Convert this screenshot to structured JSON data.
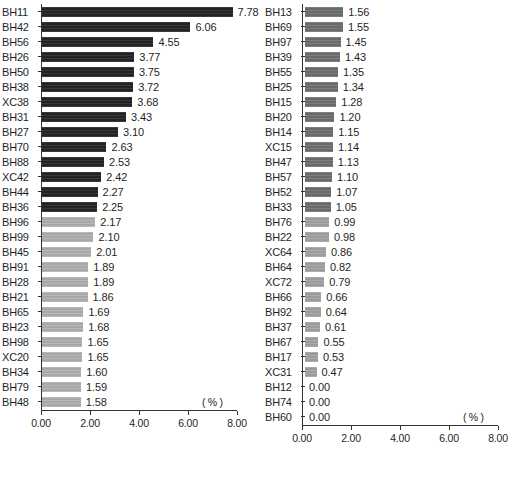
{
  "chart_data": [
    {
      "type": "bar",
      "orientation": "horizontal",
      "panel": "left",
      "title": "",
      "xlabel": "( % )",
      "ylabel": "",
      "xlim": [
        0,
        8
      ],
      "xticks": [
        "0.00",
        "2.00",
        "4.00",
        "6.00",
        "8.00"
      ],
      "grid": false,
      "unit": "( % )",
      "categories": [
        "BH11",
        "BH42",
        "BH56",
        "BH26",
        "BH50",
        "BH38",
        "XC38",
        "BH31",
        "BH27",
        "BH70",
        "BH88",
        "XC42",
        "BH44",
        "BH36",
        "BH96",
        "BH99",
        "BH45",
        "BH91",
        "BH28",
        "BH21",
        "BH65",
        "BH23",
        "BH98",
        "XC20",
        "BH34",
        "BH79",
        "BH48"
      ],
      "values": [
        7.78,
        6.06,
        4.55,
        3.77,
        3.75,
        3.72,
        3.68,
        3.43,
        3.1,
        2.63,
        2.53,
        2.42,
        2.27,
        2.25,
        2.17,
        2.1,
        2.01,
        1.89,
        1.89,
        1.86,
        1.69,
        1.68,
        1.65,
        1.65,
        1.6,
        1.59,
        1.58
      ],
      "value_labels": [
        "7.78",
        "6.06",
        "4.55",
        "3.77",
        "3.75",
        "3.72",
        "3.68",
        "3.43",
        "3.10",
        "2.63",
        "2.53",
        "2.42",
        "2.27",
        "2.25",
        "2.17",
        "2.10",
        "2.01",
        "1.89",
        "1.89",
        "1.86",
        "1.69",
        "1.68",
        "1.65",
        "1.65",
        "1.60",
        "1.59",
        "1.58"
      ],
      "bar_styles": [
        "dark",
        "dark",
        "dark",
        "dark",
        "dark",
        "dark",
        "dark",
        "dark",
        "dark",
        "dark",
        "dark",
        "dark",
        "dark",
        "dark",
        "light",
        "light",
        "light",
        "light",
        "light",
        "light",
        "light",
        "light",
        "light",
        "light",
        "light",
        "light",
        "light"
      ]
    },
    {
      "type": "bar",
      "orientation": "horizontal",
      "panel": "right",
      "title": "",
      "xlabel": "( % )",
      "ylabel": "",
      "xlim": [
        0,
        8
      ],
      "xticks": [
        "0.00",
        "2.00",
        "4.00",
        "6.00",
        "8.00"
      ],
      "grid": false,
      "unit": "( % )",
      "categories": [
        "BH13",
        "BH69",
        "BH97",
        "BH39",
        "BH55",
        "BH25",
        "BH15",
        "BH20",
        "BH14",
        "XC15",
        "BH47",
        "BH57",
        "BH52",
        "BH33",
        "BH76",
        "BH22",
        "XC64",
        "BH64",
        "XC72",
        "BH66",
        "BH92",
        "BH37",
        "BH67",
        "BH17",
        "XC31",
        "BH12",
        "BH74",
        "BH60"
      ],
      "values": [
        1.56,
        1.55,
        1.45,
        1.43,
        1.35,
        1.34,
        1.28,
        1.2,
        1.15,
        1.14,
        1.13,
        1.1,
        1.07,
        1.05,
        0.99,
        0.98,
        0.86,
        0.82,
        0.79,
        0.66,
        0.64,
        0.61,
        0.55,
        0.53,
        0.47,
        0.0,
        0.0,
        0.0
      ],
      "value_labels": [
        "1.56",
        "1.55",
        "1.45",
        "1.43",
        "1.35",
        "1.34",
        "1.28",
        "1.20",
        "1.15",
        "1.14",
        "1.13",
        "1.10",
        "1.07",
        "1.05",
        "0.99",
        "0.98",
        "0.86",
        "0.82",
        "0.79",
        "0.66",
        "0.64",
        "0.61",
        "0.55",
        "0.53",
        "0.47",
        "0.00",
        "0.00",
        "0.00"
      ],
      "bar_styles": [
        "mid",
        "mid",
        "mid",
        "mid",
        "mid",
        "mid",
        "mid",
        "mid",
        "mid",
        "mid",
        "mid",
        "mid",
        "mid",
        "mid",
        "lighter",
        "lighter",
        "lighter",
        "lighter",
        "lighter",
        "lighter",
        "lighter",
        "lighter",
        "lighter",
        "lighter",
        "lighter",
        "lighter",
        "lighter",
        "lighter"
      ]
    }
  ],
  "colors": {
    "bar_dark": "#232323",
    "bar_mid": "#6a6a6a",
    "bar_light": "#a8a8a8",
    "bar_lighter": "#9b9b9b",
    "axis": "#333333",
    "text": "#1f1f1f"
  }
}
